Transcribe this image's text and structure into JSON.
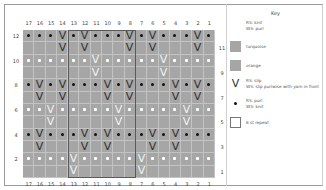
{
  "key": {
    "title": "Key",
    "items": [
      {
        "symbol": "blank-white",
        "line1": "RS: knit",
        "line2": "WS: purl"
      },
      {
        "symbol": "grey-swatch",
        "line1": "turquoise",
        "line2": ""
      },
      {
        "symbol": "grey-swatch",
        "line1": "orange",
        "line2": ""
      },
      {
        "symbol": "v-slip",
        "line1": "RS: slip",
        "line2": "WS: slip purlwise with yarn in front"
      },
      {
        "symbol": "dot",
        "line1": "RS: purl",
        "line2": "WS: knit"
      },
      {
        "symbol": "outline-box",
        "line1": "6 st repeat",
        "line2": ""
      }
    ]
  },
  "chart": {
    "columns": [
      "17",
      "16",
      "15",
      "14",
      "13",
      "12",
      "11",
      "10",
      "9",
      "8",
      "7",
      "6",
      "5",
      "4",
      "3",
      "2",
      "1"
    ],
    "rows_left": [
      "12",
      "",
      "10",
      "",
      "8",
      "",
      "6",
      "",
      "4",
      "",
      "2",
      ""
    ],
    "rows_right": [
      "",
      "11",
      "",
      "9",
      "",
      "7",
      "",
      "5",
      "",
      "3",
      "",
      "1"
    ],
    "repeat": {
      "from_col": 13,
      "to_col": 8,
      "label": "6 st repeat"
    },
    "grid": [
      [
        "•",
        "•",
        "•",
        "V",
        "•",
        "V",
        "•",
        "•",
        "•",
        "V",
        "•",
        "V",
        "•",
        "•",
        "•",
        "V",
        "•"
      ],
      [
        "",
        "",
        "",
        "V",
        "",
        "V",
        "",
        "",
        "",
        "V",
        "",
        "V",
        "",
        "",
        "",
        "V",
        ""
      ],
      [
        "o",
        "o",
        "o",
        "o",
        "o",
        "o",
        "V",
        "o",
        "o",
        "o",
        "o",
        "o",
        "V",
        "o",
        "o",
        "o",
        "o"
      ],
      [
        "",
        "",
        "",
        "",
        "",
        "",
        "V",
        "",
        "",
        "",
        "",
        "",
        "V",
        "",
        "",
        "",
        ""
      ],
      [
        "•",
        "V",
        "•",
        "V",
        "•",
        "•",
        "•",
        "V",
        "•",
        "V",
        "•",
        "•",
        "•",
        "V",
        "•",
        "V",
        "•"
      ],
      [
        "",
        "V",
        "",
        "V",
        "",
        "",
        "",
        "V",
        "",
        "V",
        "",
        "",
        "",
        "V",
        "",
        "V",
        ""
      ],
      [
        "o",
        "o",
        "V",
        "o",
        "o",
        "o",
        "o",
        "o",
        "V",
        "o",
        "o",
        "o",
        "o",
        "o",
        "V",
        "o",
        "o"
      ],
      [
        "",
        "",
        "V",
        "",
        "",
        "",
        "",
        "",
        "V",
        "",
        "",
        "",
        "",
        "",
        "V",
        "",
        ""
      ],
      [
        "•",
        "V",
        "•",
        "•",
        "•",
        "V",
        "•",
        "V",
        "•",
        "•",
        "•",
        "V",
        "•",
        "V",
        "•",
        "•",
        "•"
      ],
      [
        "",
        "V",
        "",
        "",
        "",
        "V",
        "",
        "V",
        "",
        "",
        "",
        "V",
        "",
        "V",
        "",
        "",
        ""
      ],
      [
        "o",
        "o",
        "o",
        "o",
        "V",
        "o",
        "o",
        "o",
        "o",
        "o",
        "V",
        "o",
        "o",
        "o",
        "o",
        "o",
        "o"
      ],
      [
        "",
        "",
        "",
        "",
        "V",
        "",
        "",
        "",
        "",
        "",
        "V",
        "",
        "",
        "",
        "",
        "",
        ""
      ]
    ]
  },
  "colors": {
    "cell": "#a6a6a6",
    "gridline": "#c3c3c3",
    "repeat_outline": "#5a5a5a"
  }
}
